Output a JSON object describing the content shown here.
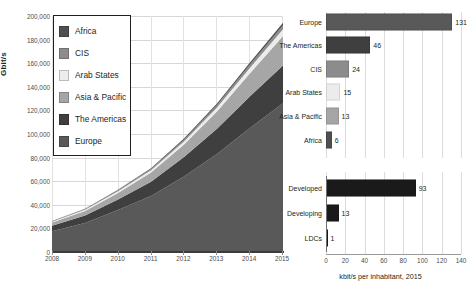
{
  "chart_data": [
    {
      "id": "international-bandwidth-area",
      "type": "area",
      "stacked": true,
      "title": "",
      "xlabel": "",
      "ylabel": "Gbit/s",
      "x": [
        2008,
        2009,
        2010,
        2011,
        2012,
        2013,
        2014,
        2015
      ],
      "xticklabels": [
        "2008",
        "2009",
        "2010",
        "2011",
        "2012",
        "2013",
        "2014",
        "2015"
      ],
      "ylim": [
        0,
        200000
      ],
      "yticks": [
        0,
        20000,
        40000,
        60000,
        80000,
        100000,
        120000,
        140000,
        160000,
        180000,
        200000
      ],
      "yticklabels": [
        "0",
        "20,000",
        "40,000",
        "60,000",
        "80,000",
        "100,000",
        "120,000",
        "140,000",
        "160,000",
        "180,000",
        "200,000"
      ],
      "grid": true,
      "legend_position": "upper-left",
      "series": [
        {
          "name": "Europe",
          "color": "#595959",
          "values": [
            17500,
            24500,
            35500,
            47500,
            64000,
            83000,
            105000,
            126000
          ]
        },
        {
          "name": "The Americas",
          "color": "#3f3f3f",
          "values": [
            4800,
            6500,
            9000,
            12000,
            16500,
            21500,
            27000,
            32000
          ]
        },
        {
          "name": "Asia & Pacific",
          "color": "#a6a6a6",
          "values": [
            2700,
            3800,
            5600,
            7800,
            10500,
            14500,
            19500,
            25000
          ]
        },
        {
          "name": "Arab States",
          "color": "#ececec",
          "values": [
            700,
            1000,
            1400,
            1900,
            2600,
            3500,
            4600,
            5800
          ]
        },
        {
          "name": "CIS",
          "color": "#8c8c8c",
          "values": [
            450,
            650,
            900,
            1200,
            1600,
            2100,
            2700,
            3300
          ]
        },
        {
          "name": "Africa",
          "color": "#4f4f4f",
          "values": [
            200,
            300,
            450,
            650,
            900,
            1300,
            1700,
            2100
          ]
        }
      ]
    },
    {
      "id": "bandwidth-per-inhabitant-by-region",
      "type": "bar",
      "orientation": "horizontal",
      "categories": [
        "Europe",
        "The Americas",
        "CIS",
        "Arab States",
        "Asia & Pacific",
        "Africa"
      ],
      "values": [
        131,
        46,
        24,
        15,
        13,
        6
      ],
      "colors": [
        "#595959",
        "#3f3f3f",
        "#8c8c8c",
        "#ececec",
        "#a6a6a6",
        "#4f4f4f"
      ],
      "xlim": [
        0,
        140
      ],
      "xticks": [
        0,
        20,
        40,
        60,
        80,
        100,
        120,
        140
      ],
      "grid": true
    },
    {
      "id": "bandwidth-per-inhabitant-by-development",
      "type": "bar",
      "orientation": "horizontal",
      "categories": [
        "Developed",
        "Developing",
        "LDCs"
      ],
      "values": [
        93,
        13,
        1
      ],
      "colors": [
        "#1a1a1a",
        "#1a1a1a",
        "#1a1a1a"
      ],
      "xlim": [
        0,
        140
      ],
      "xticks": [
        0,
        20,
        40,
        60,
        80,
        100,
        120,
        140
      ],
      "xticklabels": [
        "0",
        "20",
        "40",
        "60",
        "80",
        "100",
        "120",
        "140"
      ],
      "caption": "kbit/s per inhabitant, 2015",
      "grid": true
    }
  ],
  "area_chart": {
    "ylabel": "Gbit/s",
    "yticklabels": [
      "200,000",
      "180,000",
      "160,000",
      "140,000",
      "120,000",
      "100,000",
      "80,000",
      "60,000",
      "40,000",
      "20,000",
      "0"
    ],
    "xticklabels": [
      "2008",
      "2009",
      "2010",
      "2011",
      "2012",
      "2013",
      "2014",
      "2015"
    ],
    "legend": [
      {
        "label": "Africa",
        "color": "#4f4f4f"
      },
      {
        "label": "CIS",
        "color": "#8c8c8c"
      },
      {
        "label": "Arab States",
        "color": "#ececec"
      },
      {
        "label": "Asia & Pacific",
        "color": "#a6a6a6"
      },
      {
        "label": "The Americas",
        "color": "#3f3f3f"
      },
      {
        "label": "Europe",
        "color": "#595959"
      }
    ]
  },
  "bar_panel_top": {
    "rows": [
      {
        "label": "Europe",
        "value": "131",
        "number": 131,
        "color": "#595959"
      },
      {
        "label": "The Americas",
        "value": "46",
        "number": 46,
        "color": "#3f3f3f"
      },
      {
        "label": "CIS",
        "value": "24",
        "number": 24,
        "color": "#8c8c8c"
      },
      {
        "label": "Arab States",
        "value": "15",
        "number": 15,
        "color": "#ececec"
      },
      {
        "label": "Asia & Pacific",
        "value": "13",
        "number": 13,
        "color": "#a6a6a6"
      },
      {
        "label": "Africa",
        "value": "6",
        "number": 6,
        "color": "#4f4f4f"
      }
    ]
  },
  "bar_panel_bottom": {
    "rows": [
      {
        "label": "Developed",
        "value": "93",
        "number": 93,
        "color": "#1a1a1a"
      },
      {
        "label": "Developing",
        "value": "13",
        "number": 13,
        "color": "#1a1a1a"
      },
      {
        "label": "LDCs",
        "value": "1",
        "number": 1,
        "color": "#1a1a1a"
      }
    ],
    "xticklabels": [
      "0",
      "20",
      "40",
      "60",
      "80",
      "100",
      "120",
      "140"
    ],
    "caption": "kbit/s per inhabitant, 2015"
  }
}
